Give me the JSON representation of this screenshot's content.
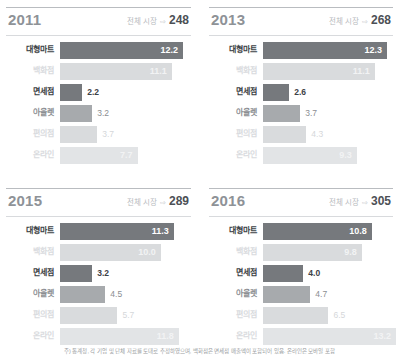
{
  "footnote": "주) 통계청, 각 기업 및 단체 자료를 토대로 추정하였으며, 백화점은 면세점 매출액이 포함되어 있음. 온라인은 모바일 포함",
  "market_label": "전체 시장",
  "market_arrow": "⇨",
  "chart_data": {
    "type": "bar",
    "title": "",
    "xlabel": "",
    "ylabel": "",
    "categories": [
      "대형마트",
      "백화점",
      "면세점",
      "아울렛",
      "편의점",
      "온라인"
    ],
    "unit": "조원",
    "panels": [
      {
        "year": "2011",
        "total_label": "전체 시장",
        "total": "248",
        "rows": [
          {
            "label": "대형마트",
            "value": "12.2",
            "emphasis": "strong",
            "bar": "dark",
            "value_position": "inside"
          },
          {
            "label": "백화점",
            "value": "11.1",
            "emphasis": "mute",
            "bar": "light",
            "value_position": "inside"
          },
          {
            "label": "면세점",
            "value": "2.2",
            "emphasis": "strong",
            "bar": "dark",
            "value_position": "outside"
          },
          {
            "label": "아울렛",
            "value": "3.2",
            "emphasis": "mid",
            "bar": "mid",
            "value_position": "outside"
          },
          {
            "label": "편의점",
            "value": "3.7",
            "emphasis": "mute",
            "bar": "light",
            "value_position": "outside"
          },
          {
            "label": "온라인",
            "value": "7.7",
            "emphasis": "mute",
            "bar": "pale",
            "value_position": "inside"
          }
        ]
      },
      {
        "year": "2013",
        "total_label": "전체 시장",
        "total": "268",
        "rows": [
          {
            "label": "대형마트",
            "value": "12.3",
            "emphasis": "strong",
            "bar": "dark",
            "value_position": "inside"
          },
          {
            "label": "백화점",
            "value": "11.1",
            "emphasis": "mute",
            "bar": "light",
            "value_position": "inside"
          },
          {
            "label": "면세점",
            "value": "2.6",
            "emphasis": "strong",
            "bar": "dark",
            "value_position": "outside"
          },
          {
            "label": "아울렛",
            "value": "3.7",
            "emphasis": "mid",
            "bar": "mid",
            "value_position": "outside"
          },
          {
            "label": "편의점",
            "value": "4.3",
            "emphasis": "mute",
            "bar": "light",
            "value_position": "outside"
          },
          {
            "label": "온라인",
            "value": "9.3",
            "emphasis": "mute",
            "bar": "pale",
            "value_position": "inside"
          }
        ]
      },
      {
        "year": "2015",
        "total_label": "전체 시장",
        "total": "289",
        "rows": [
          {
            "label": "대형마트",
            "value": "11.3",
            "emphasis": "strong",
            "bar": "dark",
            "value_position": "inside"
          },
          {
            "label": "백화점",
            "value": "10.0",
            "emphasis": "mute",
            "bar": "light",
            "value_position": "inside"
          },
          {
            "label": "면세점",
            "value": "3.2",
            "emphasis": "strong",
            "bar": "dark",
            "value_position": "outside"
          },
          {
            "label": "아울렛",
            "value": "4.5",
            "emphasis": "mid",
            "bar": "mid",
            "value_position": "outside"
          },
          {
            "label": "편의점",
            "value": "5.7",
            "emphasis": "mute",
            "bar": "light",
            "value_position": "outside"
          },
          {
            "label": "온라인",
            "value": "11.8",
            "emphasis": "mute",
            "bar": "pale",
            "value_position": "inside"
          }
        ]
      },
      {
        "year": "2016",
        "total_label": "전체 시장",
        "total": "305",
        "rows": [
          {
            "label": "대형마트",
            "value": "10.8",
            "emphasis": "strong",
            "bar": "dark",
            "value_position": "inside"
          },
          {
            "label": "백화점",
            "value": "9.8",
            "emphasis": "mute",
            "bar": "light",
            "value_position": "inside"
          },
          {
            "label": "면세점",
            "value": "4.0",
            "emphasis": "strong",
            "bar": "dark",
            "value_position": "outside"
          },
          {
            "label": "아울렛",
            "value": "4.7",
            "emphasis": "mid",
            "bar": "mid",
            "value_position": "outside"
          },
          {
            "label": "편의점",
            "value": "6.5",
            "emphasis": "mute",
            "bar": "light",
            "value_position": "outside"
          },
          {
            "label": "온라인",
            "value": "13.2",
            "emphasis": "mute",
            "bar": "pale",
            "value_position": "inside"
          }
        ]
      }
    ]
  }
}
